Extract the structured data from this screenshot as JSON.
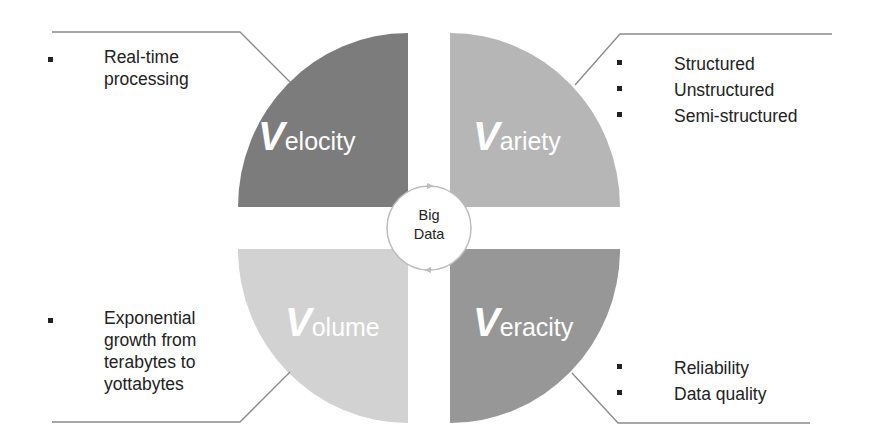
{
  "diagram": {
    "center": {
      "line1": "Big",
      "line2": "Data"
    },
    "quadrants": [
      {
        "id": "velocity",
        "initial": "V",
        "rest": "elocity",
        "color": "#7c7c7c",
        "bullets": [
          "Real-time processing"
        ],
        "bullet_lines": [
          "Real-time",
          "processing"
        ]
      },
      {
        "id": "variety",
        "initial": "V",
        "rest": "ariety",
        "color": "#b6b6b6",
        "bullets": [
          "Structured",
          "Unstructured",
          "Semi-structured"
        ]
      },
      {
        "id": "volume",
        "initial": "V",
        "rest": "olume",
        "color": "#d2d2d2",
        "bullets": [
          "Exponential growth from terabytes to yottabytes"
        ],
        "bullet_lines": [
          "Exponential",
          "growth from",
          "terabytes to",
          "yottabytes"
        ]
      },
      {
        "id": "veracity",
        "initial": "V",
        "rest": "eracity",
        "color": "#979797",
        "bullets": [
          "Reliability",
          "Data quality"
        ]
      }
    ],
    "connector_color": "#8a8a8a",
    "circle_color": "#bdbdbd"
  }
}
